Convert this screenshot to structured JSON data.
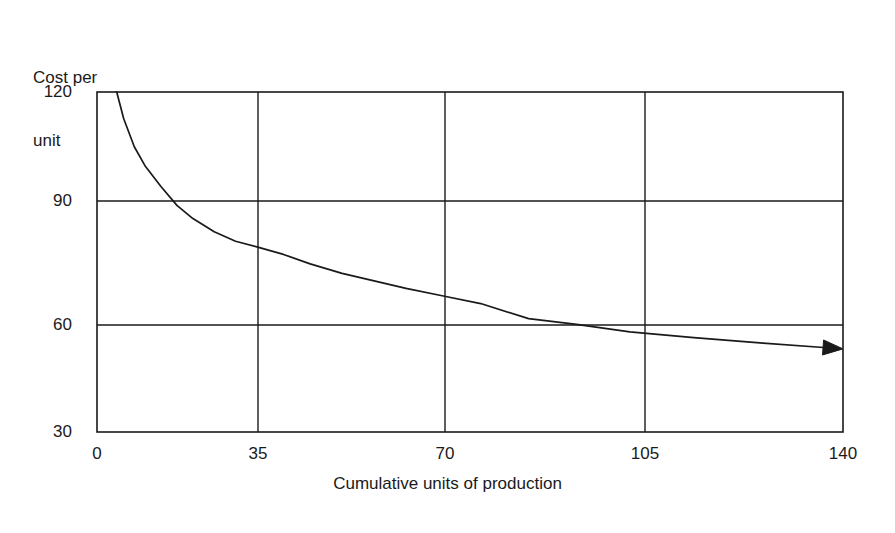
{
  "chart_data": {
    "type": "line",
    "title": "",
    "xlabel": "Cumulative units of production",
    "ylabel": "Cost per\nunit",
    "ylabel_line1": "Cost per",
    "ylabel_line2": "unit",
    "xlim": [
      0,
      140
    ],
    "ylim": [
      30,
      120
    ],
    "xticks": [
      0,
      35,
      70,
      105,
      140
    ],
    "xtick_labels": [
      "0",
      "35",
      "70",
      "105",
      "140"
    ],
    "yticks": [
      30,
      60,
      90,
      120
    ],
    "ytick_labels": [
      "30",
      "60",
      "90",
      "120"
    ],
    "grid": true,
    "legend": false,
    "line_color": "#1a1a1a",
    "arrow_end": true,
    "series": [
      {
        "name": "Experience curve",
        "x": [
          3.7,
          5,
          7,
          9,
          12,
          15,
          18,
          22,
          26,
          30,
          35,
          40,
          46,
          52,
          58,
          65,
          72,
          81,
          90,
          100,
          112,
          125,
          140
        ],
        "y": [
          120,
          113,
          105.5,
          100.5,
          95,
          90,
          86.5,
          83,
          80.5,
          79,
          77,
          74.5,
          72,
          70,
          68,
          66,
          64,
          60,
          58.5,
          56.5,
          55,
          53.5,
          52
        ]
      }
    ]
  },
  "figure": {
    "background": "#ffffff",
    "axis_color": "#1a1a1a",
    "grid_color": "#1a1a1a"
  }
}
